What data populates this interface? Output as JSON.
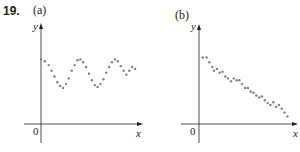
{
  "problem_number": "19.",
  "chart_data": [
    {
      "type": "scatter",
      "label": "(a)",
      "xlabel": "x",
      "ylabel": "y",
      "origin_label": "0",
      "grid": false,
      "description": "Oscillating (periodic) pattern of points, roughly sinusoidal with ~2.5 cycles, values well above zero",
      "x": [
        0.0,
        0.04,
        0.08,
        0.11,
        0.14,
        0.17,
        0.2,
        0.23,
        0.26,
        0.29,
        0.32,
        0.35,
        0.38,
        0.41,
        0.44,
        0.47,
        0.5,
        0.53,
        0.56,
        0.59,
        0.62,
        0.65,
        0.68,
        0.71,
        0.74,
        0.77,
        0.8,
        0.83,
        0.86,
        0.89,
        0.92,
        0.95,
        0.98
      ],
      "y": [
        0.68,
        0.66,
        0.62,
        0.56,
        0.5,
        0.44,
        0.4,
        0.38,
        0.42,
        0.48,
        0.56,
        0.62,
        0.67,
        0.68,
        0.65,
        0.6,
        0.53,
        0.46,
        0.41,
        0.39,
        0.42,
        0.47,
        0.54,
        0.6,
        0.65,
        0.68,
        0.66,
        0.61,
        0.56,
        0.52,
        0.56,
        0.6,
        0.58
      ],
      "xlim": [
        0,
        1
      ],
      "ylim": [
        0,
        1
      ]
    },
    {
      "type": "scatter",
      "label": "(b)",
      "xlabel": "x",
      "ylabel": "y",
      "origin_label": "0",
      "grid": false,
      "description": "Negative linear trend of points decreasing from upper left to lower right",
      "x": [
        0.04,
        0.08,
        0.11,
        0.14,
        0.16,
        0.19,
        0.22,
        0.25,
        0.28,
        0.31,
        0.34,
        0.37,
        0.4,
        0.43,
        0.46,
        0.49,
        0.52,
        0.55,
        0.58,
        0.61,
        0.64,
        0.67,
        0.7,
        0.73,
        0.76,
        0.79,
        0.82,
        0.85,
        0.88,
        0.91,
        0.94
      ],
      "y": [
        0.7,
        0.7,
        0.65,
        0.6,
        0.56,
        0.58,
        0.54,
        0.55,
        0.5,
        0.48,
        0.45,
        0.48,
        0.46,
        0.46,
        0.42,
        0.38,
        0.38,
        0.34,
        0.33,
        0.3,
        0.28,
        0.29,
        0.25,
        0.22,
        0.2,
        0.23,
        0.18,
        0.2,
        0.16,
        0.12,
        0.08
      ],
      "xlim": [
        0,
        1
      ],
      "ylim": [
        0,
        1
      ]
    }
  ]
}
